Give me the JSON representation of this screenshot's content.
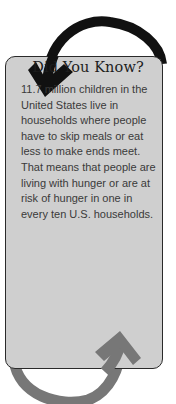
{
  "callout": {
    "title": "Did You Know?",
    "body": "11.7 million children in the United States live in households where people have to skip meals or eat less to make ends meet. That means that people are living with hunger or are at risk of hunger in one in every ten U.S. households."
  },
  "colors": {
    "card_background": "#cfcfcf",
    "card_border": "#2a2a2a",
    "top_arrow": "#111111",
    "bottom_arrow": "#777777"
  },
  "icons": {
    "top": "curved-arrow-down-icon",
    "bottom": "curved-arrow-up-icon"
  }
}
